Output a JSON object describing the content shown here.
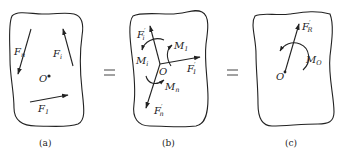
{
  "figure": {
    "panels": [
      {
        "id": "a",
        "caption": "(a)",
        "point_label": "O",
        "forces": [
          {
            "name": "F",
            "sub": "n",
            "prime": ""
          },
          {
            "name": "F",
            "sub": "i",
            "prime": ""
          },
          {
            "name": "F",
            "sub": "1",
            "prime": ""
          }
        ]
      },
      {
        "id": "b",
        "caption": "(b)",
        "point_label": "O",
        "forces": [
          {
            "name": "F",
            "sub": "i",
            "prime": "′"
          },
          {
            "name": "F",
            "sub": "1",
            "prime": "′"
          },
          {
            "name": "F",
            "sub": "n",
            "prime": "′"
          }
        ],
        "moments": [
          {
            "name": "M",
            "sub": "i"
          },
          {
            "name": "M",
            "sub": "1"
          },
          {
            "name": "M",
            "sub": "n"
          }
        ]
      },
      {
        "id": "c",
        "caption": "(c)",
        "point_label": "O",
        "forces": [
          {
            "name": "F",
            "sub": "R",
            "prime": "′"
          }
        ],
        "moments": [
          {
            "name": "M",
            "sub": "O"
          }
        ]
      }
    ],
    "operators": [
      "=",
      "="
    ]
  }
}
